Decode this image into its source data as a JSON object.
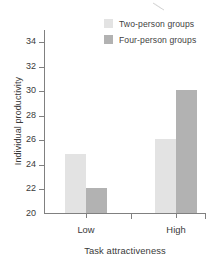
{
  "chart_data": {
    "type": "bar",
    "title": "",
    "xlabel": "Task attractiveness",
    "ylabel": "Individual productivity",
    "categories": [
      "Low",
      "High"
    ],
    "series": [
      {
        "name": "Two-person groups",
        "values": [
          24.8,
          26.0
        ],
        "color": "#e3e3e3"
      },
      {
        "name": "Four-person groups",
        "values": [
          22.0,
          30.0
        ],
        "color": "#b2b2b2"
      }
    ],
    "ylim": [
      20,
      35
    ],
    "yticks": [
      22,
      24,
      26,
      28,
      30,
      32,
      34
    ],
    "ytick_labels": [
      "22",
      "24",
      "26",
      "28",
      "30",
      "32",
      "34"
    ],
    "grid": false,
    "legend_position": "top-right",
    "axis_color": "#808080",
    "text_color": "#3a3a3a",
    "background": "#ffffff"
  },
  "legend": {
    "entries": [
      {
        "label": "Two-person groups",
        "swatch": "#e3e3e3"
      },
      {
        "label": "Four-person groups",
        "swatch": "#b2b2b2"
      }
    ]
  },
  "artifact": {
    "name": "scan-smudge-mark"
  }
}
